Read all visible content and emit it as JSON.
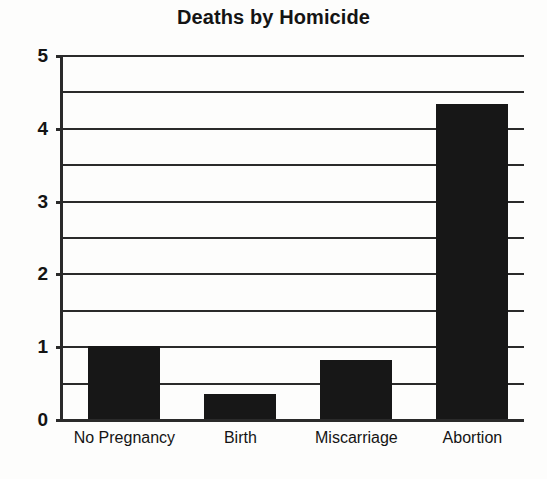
{
  "chart_data": {
    "type": "bar",
    "title": "Deaths by Homicide",
    "xlabel": "",
    "ylabel": "",
    "categories": [
      "No Pregnancy",
      "Birth",
      "Miscarriage",
      "Abortion"
    ],
    "values": [
      1.0,
      0.34,
      0.81,
      4.33
    ],
    "ylim": [
      0,
      5
    ],
    "ytick_labels": [
      "0",
      "1",
      "2",
      "3",
      "4",
      "5"
    ],
    "ytick_values": [
      0,
      1,
      2,
      3,
      4,
      5
    ],
    "gridlines": [
      0,
      0.5,
      1,
      1.5,
      2,
      2.5,
      3,
      3.5,
      4,
      4.5,
      5
    ],
    "grid": true,
    "legend": null,
    "bar_color": "#171717",
    "axis_color": "#2a2a2a",
    "background_color": "#fdfdfc"
  }
}
